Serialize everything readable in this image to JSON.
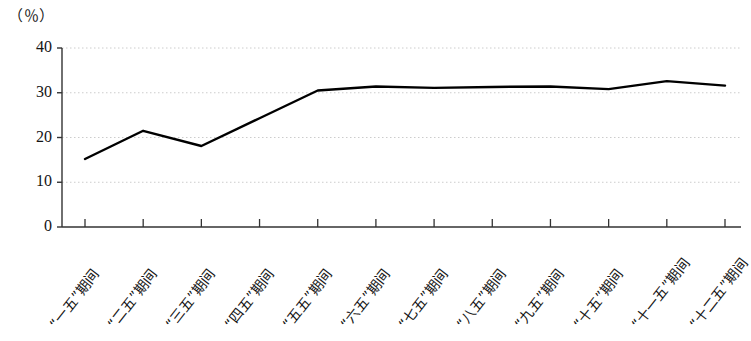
{
  "chart_data": {
    "type": "line",
    "title": "",
    "subtitle": "",
    "xlabel": "",
    "ylabel": "",
    "unit_label": "（％）",
    "categories": [
      "“一五”期间",
      "“二五”期间",
      "“三五”期间",
      "“四五”期间",
      "“五五”期间",
      "“六五”期间",
      "“七五”期间",
      "“八五”期间",
      "“九五”期间",
      "“十五”期间",
      "“十一五”期间",
      "“十二五”期间"
    ],
    "values": [
      15.2,
      21.5,
      18.1,
      24.3,
      30.5,
      31.4,
      31.1,
      31.3,
      31.4,
      30.8,
      32.6,
      31.6
    ],
    "series": [
      {
        "name": "",
        "values": [
          15.2,
          21.5,
          18.1,
          24.3,
          30.5,
          31.4,
          31.1,
          31.3,
          31.4,
          30.8,
          32.6,
          31.6
        ]
      }
    ],
    "ylim": [
      0,
      40
    ],
    "yticks": [
      0,
      10,
      20,
      30,
      40
    ],
    "ytick_labels": [
      "0",
      "10",
      "20",
      "30",
      "40"
    ],
    "grid": true,
    "grid_axis": "y",
    "grid_style": "dotted",
    "legend": false,
    "legend_position": "none",
    "line_color": "#000000",
    "grid_color": "#cccccc",
    "axis_color": "#333333",
    "markers": false
  },
  "axes": {
    "y_unit": "（％）"
  }
}
